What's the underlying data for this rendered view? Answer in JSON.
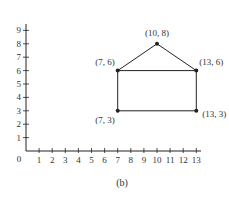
{
  "figure": {
    "caption": "(b)",
    "axes": {
      "x_ticks": [
        "1",
        "2",
        "3",
        "4",
        "5",
        "6",
        "7",
        "8",
        "9",
        "10",
        "11",
        "12",
        "13"
      ],
      "y_ticks": [
        "1",
        "2",
        "3",
        "4",
        "5",
        "6",
        "7",
        "8",
        "9"
      ],
      "origin_label": "0",
      "xlim": [
        0,
        13
      ],
      "ylim": [
        0,
        9
      ]
    },
    "points": [
      {
        "x": 7,
        "y": 3,
        "label": "(7, 3)",
        "label_pos": "bottom-left"
      },
      {
        "x": 7,
        "y": 6,
        "label": "(7, 6)",
        "label_pos": "top-left"
      },
      {
        "x": 10,
        "y": 8,
        "label": "(10, 8)",
        "label_pos": "top"
      },
      {
        "x": 13,
        "y": 6,
        "label": "(13, 6)",
        "label_pos": "top-right"
      },
      {
        "x": 13,
        "y": 3,
        "label": "(13, 3)",
        "label_pos": "bottom-right"
      }
    ],
    "edges": [
      [
        0,
        1
      ],
      [
        1,
        2
      ],
      [
        2,
        3
      ],
      [
        3,
        4
      ],
      [
        4,
        0
      ],
      [
        1,
        3
      ]
    ],
    "colors": {
      "ink": "#222222"
    }
  }
}
